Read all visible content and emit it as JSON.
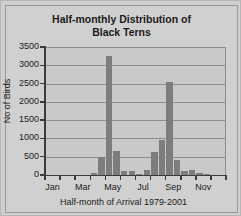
{
  "chart_data": {
    "type": "bar",
    "title": "Half-monthly Distribution of Black Terns",
    "title_line1": "Half-monthly Distribution of",
    "title_line2": "Black Terns",
    "xlabel": "Half-month of Arrival 1979-2001",
    "ylabel": "No of Birds",
    "ylim": [
      0,
      3500
    ],
    "ytick_labels": [
      "3500",
      "3000",
      "2500",
      "2000",
      "1500",
      "1000",
      "500",
      "0"
    ],
    "ytick_values": [
      3500,
      3000,
      2500,
      2000,
      1500,
      1000,
      500,
      0
    ],
    "xtick_labels": [
      "Jan",
      "Mar",
      "May",
      "Jul",
      "Sep",
      "Nov"
    ],
    "grid": true,
    "legend": "none",
    "bar_color": "#7d7d7d",
    "plot_background": "#c9c9c9",
    "categories": [
      "Jan-1",
      "Jan-2",
      "Feb-1",
      "Feb-2",
      "Mar-1",
      "Mar-2",
      "Apr-1",
      "Apr-2",
      "May-1",
      "May-2",
      "Jun-1",
      "Jun-2",
      "Jul-1",
      "Jul-2",
      "Aug-1",
      "Aug-2",
      "Sep-1",
      "Sep-2",
      "Oct-1",
      "Oct-2",
      "Nov-1",
      "Nov-2",
      "Dec-1",
      "Dec-2"
    ],
    "values": [
      0,
      0,
      0,
      0,
      0,
      0,
      60,
      490,
      3260,
      660,
      120,
      100,
      40,
      140,
      620,
      950,
      2550,
      400,
      120,
      130,
      60,
      20,
      0,
      0
    ]
  }
}
